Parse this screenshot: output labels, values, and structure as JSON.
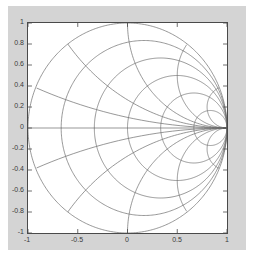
{
  "figure": {
    "background_color": "#d4d4d4",
    "axes_background_color": "#ffffff",
    "axes_border_color": "#4a4a4a",
    "grid_color": "#6b6b6b",
    "title": "",
    "xlabel": "",
    "ylabel": ""
  },
  "axis": {
    "x_ticks": [
      "-1",
      "-0.5",
      "0",
      "0.5",
      "1"
    ],
    "x_tick_values": [
      -1,
      -0.5,
      0,
      0.5,
      1
    ],
    "y_ticks": [
      "1",
      "0.8",
      "0.6",
      "0.4",
      "0.2",
      "0",
      "-0.2",
      "-0.4",
      "-0.6",
      "-0.8",
      "-1"
    ],
    "y_tick_values": [
      1,
      0.8,
      0.6,
      0.4,
      0.2,
      0,
      -0.2,
      -0.4,
      -0.6,
      -0.8,
      -1
    ],
    "xlim": [
      -1,
      1
    ],
    "ylim": [
      -1,
      1
    ]
  },
  "chart_data": {
    "type": "line",
    "title": "",
    "xlabel": "",
    "ylabel": "",
    "xlim": [
      -1,
      1
    ],
    "ylim": [
      -1,
      1
    ],
    "grid": false,
    "legend": "none",
    "unit_circle": {
      "center": [
        0,
        0
      ],
      "radius": 1
    },
    "real_axis_line": {
      "from": [
        -1,
        0
      ],
      "to": [
        1,
        0
      ]
    },
    "resistance_circles": [
      {
        "r": 0.0,
        "center": [
          0.0,
          0.0
        ],
        "radius": 1.0
      },
      {
        "r": 0.2,
        "center": [
          0.1667,
          0.0
        ],
        "radius": 0.8333
      },
      {
        "r": 0.5,
        "center": [
          0.3333,
          0.0
        ],
        "radius": 0.6667
      },
      {
        "r": 1.0,
        "center": [
          0.5,
          0.0
        ],
        "radius": 0.5
      },
      {
        "r": 2.0,
        "center": [
          0.6667,
          0.0
        ],
        "radius": 0.3333
      },
      {
        "r": 5.0,
        "center": [
          0.8333,
          0.0
        ],
        "radius": 0.1667
      }
    ],
    "reactance_arcs": [
      {
        "x": 0.2,
        "center": [
          1.0,
          5.0
        ],
        "radius": 5.0
      },
      {
        "x": 0.5,
        "center": [
          1.0,
          2.0
        ],
        "radius": 2.0
      },
      {
        "x": 1.0,
        "center": [
          1.0,
          1.0
        ],
        "radius": 1.0
      },
      {
        "x": 2.0,
        "center": [
          1.0,
          0.5
        ],
        "radius": 0.5
      },
      {
        "x": 5.0,
        "center": [
          1.0,
          0.2
        ],
        "radius": 0.2
      },
      {
        "x": -0.2,
        "center": [
          1.0,
          -5.0
        ],
        "radius": 5.0
      },
      {
        "x": -0.5,
        "center": [
          1.0,
          -2.0
        ],
        "radius": 2.0
      },
      {
        "x": -1.0,
        "center": [
          1.0,
          -1.0
        ],
        "radius": 1.0
      },
      {
        "x": -2.0,
        "center": [
          1.0,
          -0.5
        ],
        "radius": 0.5
      },
      {
        "x": -5.0,
        "center": [
          1.0,
          -0.2
        ],
        "radius": 0.2
      }
    ]
  }
}
